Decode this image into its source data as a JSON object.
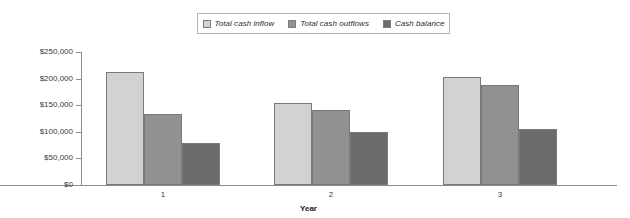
{
  "chart_data": {
    "type": "bar",
    "title": "",
    "xlabel": "Year",
    "ylabel": "",
    "categories": [
      "1",
      "2",
      "3"
    ],
    "series": [
      {
        "name": "Total cash inflow",
        "values": [
          212000,
          154000,
          203000
        ],
        "color": "#d2d2d2"
      },
      {
        "name": "Total cash outflows",
        "values": [
          134000,
          141000,
          188000
        ],
        "color": "#919191"
      },
      {
        "name": "Cash balance",
        "values": [
          79000,
          100000,
          105000
        ],
        "color": "#6b6b6b"
      }
    ],
    "ylim": [
      0,
      250000
    ],
    "ytick_labels": [
      "$250,000",
      "$200,000",
      "$150,000",
      "$100,000",
      "$50,000",
      "$0"
    ],
    "ytick_values": [
      250000,
      200000,
      150000,
      100000,
      50000,
      0
    ],
    "grid": false,
    "legend_position": "top-center"
  },
  "legend": {
    "items": [
      {
        "label": "Total cash inflow",
        "color": "#d2d2d2"
      },
      {
        "label": "Total cash outflows",
        "color": "#919191"
      },
      {
        "label": "Cash balance",
        "color": "#6b6b6b"
      }
    ]
  },
  "axes": {
    "x_title": "Year",
    "x_labels": [
      "1",
      "2",
      "3"
    ],
    "y_labels": [
      "$250,000",
      "$200,000",
      "$150,000",
      "$100,000",
      "$50,000",
      "$0"
    ]
  },
  "colors": {
    "series1": "#d2d2d2",
    "series2": "#919191",
    "series3": "#6b6b6b",
    "axis": "#8d8d8d",
    "bar_border": "#7a7a7a",
    "text": "#3a3a3a",
    "background": "#ffffff"
  }
}
